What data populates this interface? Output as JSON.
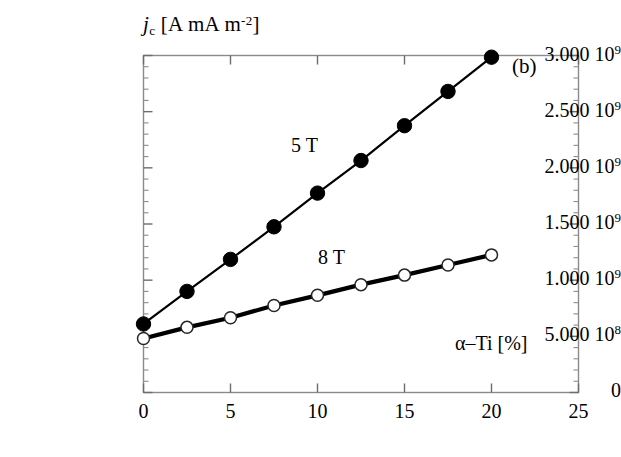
{
  "panel": {
    "label": "(b)"
  },
  "axes": {
    "y_title_symbol": "j",
    "y_title_sub": "c",
    "y_title_unit_open": " [A m",
    "y_title_unit_exp": "-2",
    "y_title_unit_close": "]",
    "x_title": "α–Ti [%]",
    "y_tick_labels": [
      {
        "text": "0",
        "sup": ""
      },
      {
        "text": "5.000 10",
        "sup": "8"
      },
      {
        "text": "1.000 10",
        "sup": "9"
      },
      {
        "text": "1.500 10",
        "sup": "9"
      },
      {
        "text": "2.000 10",
        "sup": "9"
      },
      {
        "text": "2.500 10",
        "sup": "9"
      },
      {
        "text": "3.000 10",
        "sup": "9"
      }
    ],
    "x_tick_labels": [
      "0",
      "5",
      "10",
      "15",
      "20",
      "25"
    ]
  },
  "chart_data": {
    "type": "line",
    "title": "",
    "xlabel": "α-Ti [%]",
    "ylabel": "j_c [A m^-2]",
    "xlim": [
      0,
      25
    ],
    "ylim": [
      0,
      3000000000.0
    ],
    "xticks": [
      0,
      5,
      10,
      15,
      20,
      25
    ],
    "yticks": [
      0,
      500000000,
      1000000000,
      1500000000,
      2000000000,
      2500000000,
      3000000000
    ],
    "minor_ticks_per_interval": 4,
    "grid": false,
    "legend": "inline-annotations",
    "series": [
      {
        "name": "5 T",
        "marker": "filled-circle",
        "color": "#000000",
        "x": [
          0,
          2.5,
          5,
          7.5,
          10,
          12.5,
          15,
          17.5,
          20
        ],
        "values": [
          610000000,
          900000000,
          1185000000,
          1475000000,
          1775000000,
          2065000000,
          2375000000,
          2680000000,
          2985000000
        ]
      },
      {
        "name": "8 T",
        "marker": "open-circle",
        "color": "#000000",
        "x": [
          0,
          2.5,
          5,
          7.5,
          10,
          12.5,
          15,
          17.5,
          20
        ],
        "values": [
          480000000,
          580000000,
          665000000,
          775000000,
          865000000,
          960000000,
          1045000000,
          1135000000,
          1225000000
        ]
      }
    ]
  }
}
